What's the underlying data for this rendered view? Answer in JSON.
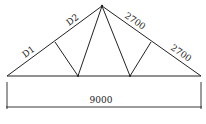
{
  "diagram": {
    "type": "roof-truss",
    "labels": {
      "left_upper_chord_lower": "D1",
      "left_upper_chord_upper": "D2",
      "right_upper_chord_upper": "2700",
      "right_upper_chord_lower": "2700",
      "span": "9000"
    },
    "colors": {
      "line": "#222222",
      "background": "#ffffff"
    }
  }
}
